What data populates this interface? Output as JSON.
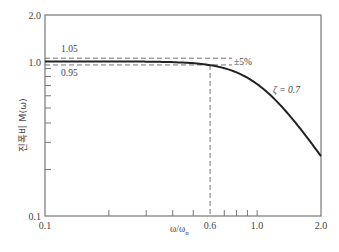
{
  "chart_data": {
    "type": "line",
    "title": "",
    "xlabel": "ω/ωn",
    "ylabel": "진폭비 M(ω)",
    "xscale": "log",
    "yscale": "log",
    "xlim": [
      0.1,
      2.0
    ],
    "ylim": [
      0.1,
      2.0
    ],
    "x_ticks_labeled": [
      "0.1",
      "0.6",
      "1.0",
      "2.0"
    ],
    "x_minor_ticks": [
      0.2,
      0.3,
      0.4,
      0.5,
      0.7,
      0.8,
      0.9
    ],
    "y_ticks_labeled": [
      "0.1",
      "1.0",
      "2.0"
    ],
    "y_minor_ticks": [
      0.2,
      0.3,
      0.4,
      0.5,
      0.6,
      0.7,
      0.8,
      0.9
    ],
    "grid": false,
    "series": [
      {
        "name": "ζ = 0.7",
        "x": [
          0.1,
          0.2,
          0.3,
          0.4,
          0.5,
          0.6,
          0.7,
          0.8,
          0.9,
          1.0,
          1.2,
          1.4,
          1.6,
          1.8,
          2.0
        ],
        "values": [
          1.0,
          1.0,
          0.996,
          0.984,
          0.961,
          0.922,
          0.868,
          0.803,
          0.776,
          0.714,
          0.585,
          0.464,
          0.367,
          0.296,
          0.244
        ]
      }
    ],
    "annotations": [
      {
        "text": "1.05",
        "type": "dashed-hline",
        "y": 1.05
      },
      {
        "text": "0.95",
        "type": "dashed-hline",
        "y": 0.95
      },
      {
        "text": "±5%",
        "type": "label"
      },
      {
        "text": "ζ = 0.7",
        "type": "series-label"
      },
      {
        "text": "",
        "type": "dashed-vline",
        "x": 0.6
      }
    ]
  },
  "labels": {
    "y_axis": "진폭비 M(ω)",
    "x_axis_main": "ω/ω",
    "x_axis_sub": "n",
    "y_2": "2.0",
    "y_1": "1.0",
    "y_01": "0.1",
    "x_01": "0.1",
    "x_06": "0.6",
    "x_10": "1.0",
    "x_20": "2.0",
    "band_upper": "1.05",
    "band_lower": "0.95",
    "band_pct": "±5%",
    "zeta": "ζ = 0.7"
  }
}
